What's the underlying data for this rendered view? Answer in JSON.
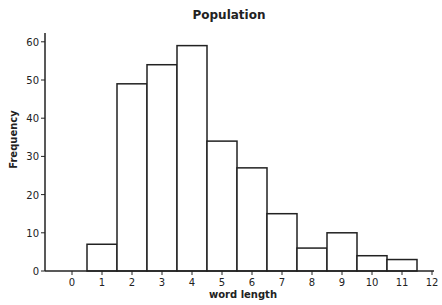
{
  "chart_data": {
    "type": "bar",
    "title": "Population",
    "xlabel": "word length",
    "ylabel": "Frequency",
    "categories": [
      1,
      2,
      3,
      4,
      5,
      6,
      7,
      8,
      9,
      10,
      11
    ],
    "values": [
      7,
      49,
      54,
      59,
      34,
      27,
      15,
      6,
      10,
      4,
      3
    ],
    "x_ticks": [
      0,
      1,
      2,
      3,
      4,
      5,
      6,
      7,
      8,
      9,
      10,
      11,
      12
    ],
    "y_ticks": [
      0,
      10,
      20,
      30,
      40,
      50,
      60
    ],
    "xlim": [
      -0.5,
      12
    ],
    "ylim": [
      0,
      62
    ],
    "grid": false,
    "legend": null,
    "bar_fill": "#ffffff",
    "bar_stroke": "#222222"
  }
}
